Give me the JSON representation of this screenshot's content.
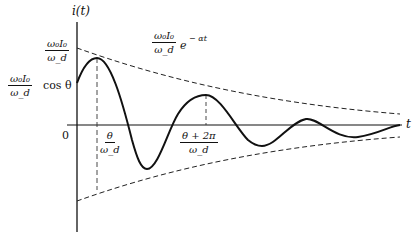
{
  "diagram": {
    "axes": {
      "y_label": "i(t)",
      "x_label": "t",
      "origin_label": "0"
    },
    "labels": {
      "peak_amplitude": {
        "num": "ω₀I₀",
        "den": "ω_d"
      },
      "initial_value": {
        "num": "ω₀I₀",
        "den": "ω_d",
        "suffix": "cos θ"
      },
      "envelope": {
        "num": "ω₀I₀",
        "den": "ω_d",
        "suffix": "e",
        "exponent": "− αt"
      },
      "first_peak_time": {
        "num": "θ",
        "den": "ω_d"
      },
      "second_peak_time": {
        "num": "θ + 2π",
        "den": "ω_d"
      }
    },
    "curves": {
      "response": "solid damped sinusoid",
      "upper_envelope": "dashed decaying exponential",
      "lower_envelope": "dashed negative decaying exponential"
    },
    "colors": {
      "ink": "#111111",
      "background": "#ffffff"
    }
  }
}
